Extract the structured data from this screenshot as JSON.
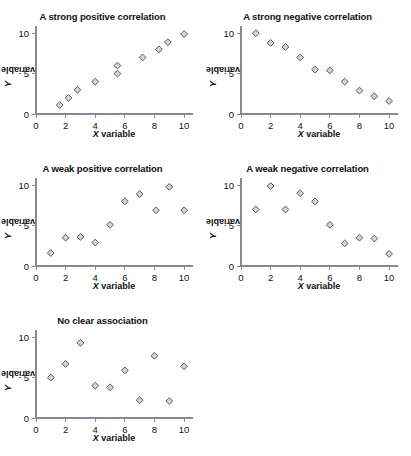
{
  "figure": {
    "background_color": "#ffffff",
    "marker_fill": "#d4d4d4",
    "marker_stroke": "#4a4a4a",
    "axis_color": "#8a8a8a",
    "text_color": "#111111"
  },
  "axis_labels": {
    "x_symbol": "X",
    "x_word": "variable",
    "y_symbol": "Y",
    "y_word": "variable"
  },
  "ticks": {
    "x": [
      "0",
      "2",
      "4",
      "6",
      "8",
      "10"
    ],
    "y": [
      "0",
      "5",
      "10"
    ]
  },
  "chart_data": [
    {
      "type": "scatter",
      "title": "A strong positive correlation",
      "xlabel": "X variable",
      "ylabel": "Y variable",
      "xlim": [
        0,
        10.6
      ],
      "ylim": [
        0,
        10.4
      ],
      "xticks": [
        0,
        2,
        4,
        6,
        8,
        10
      ],
      "yticks": [
        0,
        5,
        10
      ],
      "grid": false,
      "legend": "none",
      "x": [
        1.6,
        2.2,
        2.8,
        4.0,
        5.5,
        5.5,
        7.2,
        8.3,
        8.9,
        10.0
      ],
      "y": [
        1.1,
        2.0,
        3.0,
        4.0,
        5.0,
        6.0,
        7.0,
        8.0,
        8.9,
        9.9
      ]
    },
    {
      "type": "scatter",
      "title": "A strong negative correlation",
      "xlabel": "X variable",
      "ylabel": "Y variable",
      "xlim": [
        0,
        10.6
      ],
      "ylim": [
        0,
        10.4
      ],
      "xticks": [
        0,
        2,
        4,
        6,
        8,
        10
      ],
      "yticks": [
        0,
        5,
        10
      ],
      "grid": false,
      "legend": "none",
      "x": [
        1.0,
        2.0,
        3.0,
        4.0,
        5.0,
        6.0,
        7.0,
        8.0,
        9.0,
        10.0
      ],
      "y": [
        10.0,
        8.8,
        8.3,
        7.0,
        5.5,
        5.4,
        4.0,
        2.9,
        2.2,
        1.6
      ]
    },
    {
      "type": "scatter",
      "title": "A weak positive correlation",
      "xlabel": "X variable",
      "ylabel": "Y variable",
      "xlim": [
        0,
        10.6
      ],
      "ylim": [
        0,
        10.4
      ],
      "xticks": [
        0,
        2,
        4,
        6,
        8,
        10
      ],
      "yticks": [
        0,
        5,
        10
      ],
      "grid": false,
      "legend": "none",
      "x": [
        1.0,
        2.0,
        3.0,
        4.0,
        5.0,
        6.0,
        7.0,
        8.1,
        9.0,
        10.0
      ],
      "y": [
        1.6,
        3.5,
        3.6,
        2.9,
        5.1,
        8.0,
        8.9,
        6.9,
        9.8,
        6.9
      ]
    },
    {
      "type": "scatter",
      "title": "A weak negative correlation",
      "xlabel": "X variable",
      "ylabel": "Y variable",
      "xlim": [
        0,
        10.6
      ],
      "ylim": [
        0,
        10.4
      ],
      "xticks": [
        0,
        2,
        4,
        6,
        8,
        10
      ],
      "yticks": [
        0,
        5,
        10
      ],
      "grid": false,
      "legend": "none",
      "x": [
        1.0,
        2.0,
        3.0,
        4.0,
        5.0,
        6.0,
        7.0,
        8.0,
        9.0,
        10.0
      ],
      "y": [
        7.0,
        9.9,
        7.0,
        9.0,
        8.0,
        5.1,
        2.8,
        3.5,
        3.4,
        1.5
      ]
    },
    {
      "type": "scatter",
      "title": "No clear association",
      "xlabel": "X variable",
      "ylabel": "Y variable",
      "xlim": [
        0,
        10.6
      ],
      "ylim": [
        0,
        10.4
      ],
      "xticks": [
        0,
        2,
        4,
        6,
        8,
        10
      ],
      "yticks": [
        0,
        5,
        10
      ],
      "grid": false,
      "legend": "none",
      "x": [
        1.0,
        2.0,
        3.0,
        4.0,
        5.0,
        6.0,
        7.0,
        8.0,
        9.0,
        10.0
      ],
      "y": [
        5.0,
        6.7,
        9.3,
        4.0,
        3.8,
        5.9,
        2.2,
        7.7,
        2.1,
        6.4
      ]
    }
  ]
}
